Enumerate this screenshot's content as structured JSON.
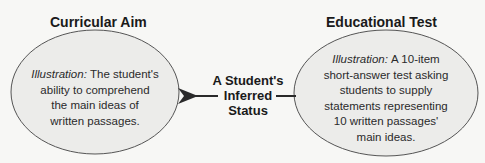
{
  "diagram": {
    "left": {
      "title": "Curricular Aim",
      "illustration_label": "Illustration:",
      "lines": [
        "The student's",
        "ability to comprehend",
        "the main ideas of",
        "written passages."
      ]
    },
    "right": {
      "title": "Educational Test",
      "illustration_label": "Illustration:",
      "lines": [
        "A 10-item",
        "short-answer test asking",
        "students to supply",
        "statements representing",
        "10 written passages'",
        "main ideas."
      ]
    },
    "center": {
      "lines": [
        "A Student's",
        "Inferred",
        "Status"
      ]
    },
    "colors": {
      "ellipse_fill": "#ececea",
      "ellipse_stroke": "#555555",
      "text": "#1a1a1a"
    }
  }
}
